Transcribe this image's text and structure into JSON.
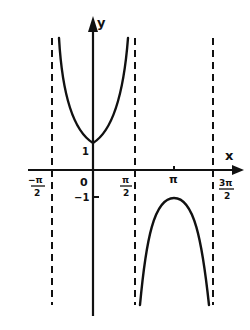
{
  "diagram": {
    "title": "",
    "function": "y = sec x",
    "colors": {
      "ink": "#111111",
      "background": "#ffffff"
    },
    "axes": {
      "x_label": "x",
      "y_label": "y",
      "origin_label": "0"
    },
    "x_ticks": [
      {
        "id": "neg_half_pi",
        "num": "−π",
        "den": "2",
        "x": 40
      },
      {
        "id": "zero",
        "text": "0",
        "x": 84
      },
      {
        "id": "half_pi",
        "num": "π",
        "den": "2",
        "x": 126
      },
      {
        "id": "pi",
        "text": "π",
        "x": 174
      },
      {
        "id": "three_half_pi",
        "num": "3π",
        "den": "2",
        "x": 228
      }
    ],
    "y_ticks": [
      {
        "id": "one",
        "text": "1"
      },
      {
        "id": "neg_one",
        "text": "−1"
      }
    ],
    "asymptotes": [
      "x = −π/2",
      "x = π/2",
      "x = 3π/2"
    ],
    "branches": [
      {
        "name": "upper-branch",
        "interval": "(−π/2, π/2)",
        "extremum": "min at (0, 1)"
      },
      {
        "name": "lower-branch",
        "interval": "(π/2, 3π/2)",
        "extremum": "max at (π, −1)"
      }
    ]
  }
}
